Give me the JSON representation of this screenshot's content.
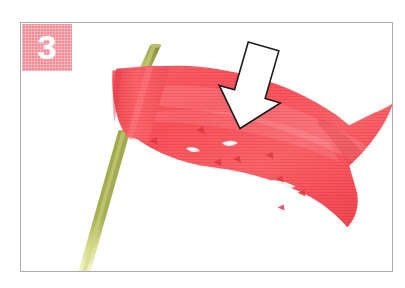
{
  "image": {
    "width": 405,
    "height": 288,
    "background_color": "#ffffff",
    "kind": "instructional-photo"
  },
  "frame": {
    "border_color": "#a9abad",
    "fill_color": "#ffffff",
    "left": 20,
    "top": 22,
    "width": 373,
    "height": 250
  },
  "badge": {
    "step_number": "3",
    "background_color": "#f28b95",
    "text_color": "#ffffff",
    "texture": "fine-grid"
  },
  "photo": {
    "subject": "red crepe-paper flag wrapped on a green stick",
    "objects": [
      {
        "name": "stick",
        "label": "green straw stick",
        "color_top": "#a6ad4e",
        "color_mid": "#9ea749",
        "color_bottom": "#e8eb9a",
        "angle_deg": 12
      },
      {
        "name": "flag",
        "label": "red cut-paper flag",
        "fill_color": "#f8555d",
        "shade_color": "#e8414c",
        "highlight_color": "#fd7d80",
        "texture": "fine-grid",
        "cutouts": 9,
        "tail": "swallowtail"
      },
      {
        "name": "arrow",
        "label": "instruction arrow pointing down at the flag",
        "fill_color": "#ffffff",
        "stroke_color": "#1a1a1a",
        "direction": "down",
        "rotation_deg": 16
      }
    ]
  }
}
